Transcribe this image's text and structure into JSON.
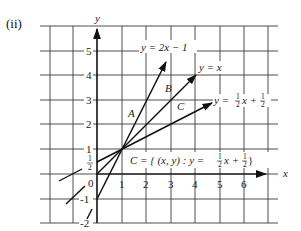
{
  "panel_label": "(ii)",
  "axes": {
    "x_label": "x",
    "y_label": "y",
    "x_ticks": [
      "0",
      "1",
      "2",
      "3",
      "4",
      "5",
      "6"
    ],
    "y_ticks": [
      "5",
      "4",
      "3",
      "2",
      "1",
      "-1",
      "-2"
    ],
    "y_half_tick": {
      "num": "1",
      "den": "2"
    }
  },
  "lines": [
    {
      "id": "A",
      "equation": "y = 2x − 1",
      "region_label": "A"
    },
    {
      "id": "B",
      "equation": "y = x",
      "region_label": "B"
    },
    {
      "id": "C",
      "equation_prefix": "y = ",
      "frac1": {
        "num": "1",
        "den": "2"
      },
      "equation_mid": "x + ",
      "frac2": {
        "num": "1",
        "den": "2"
      },
      "region_label": "C"
    }
  ],
  "set_notation": {
    "prefix": "C = { (x, y) : y = ",
    "frac1": {
      "num": "1",
      "den": "2"
    },
    "mid": "x + ",
    "frac2": {
      "num": "1",
      "den": "2"
    },
    "suffix": " }"
  },
  "colors": {
    "ink": "#111111",
    "grid": "#3a3a3a",
    "background": "#ffffff"
  }
}
